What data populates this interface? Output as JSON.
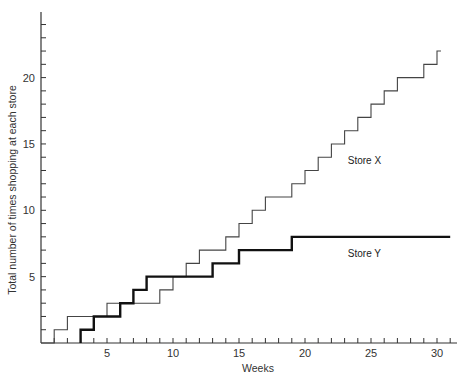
{
  "chart_data": {
    "type": "line",
    "subtype": "step",
    "title": "",
    "xlabel": "Weeks",
    "ylabel": "Total number of times shopping at each store",
    "xlim": [
      0,
      32
    ],
    "ylim": [
      0,
      25
    ],
    "x_ticks": [
      5,
      10,
      15,
      20,
      25,
      30
    ],
    "x_minor_step": 1,
    "y_ticks": [
      5,
      10,
      15,
      20
    ],
    "y_minor_step": 1,
    "grid": false,
    "legend": "inline labels",
    "series": [
      {
        "name": "Store X",
        "style": "thin",
        "label_pos": [
          24.5,
          13.5
        ],
        "points": [
          [
            0,
            0
          ],
          [
            1,
            1
          ],
          [
            2,
            2
          ],
          [
            5,
            3
          ],
          [
            9,
            4
          ],
          [
            10,
            5
          ],
          [
            11,
            6
          ],
          [
            12,
            7
          ],
          [
            14,
            8
          ],
          [
            15,
            9
          ],
          [
            16,
            10
          ],
          [
            17,
            11
          ],
          [
            19,
            12
          ],
          [
            20,
            13
          ],
          [
            21,
            14
          ],
          [
            22,
            15
          ],
          [
            23,
            16
          ],
          [
            24,
            17
          ],
          [
            25,
            18
          ],
          [
            26,
            19
          ],
          [
            27,
            20
          ],
          [
            29,
            21
          ],
          [
            30,
            22
          ],
          [
            30.3,
            22
          ]
        ]
      },
      {
        "name": "Store Y",
        "style": "thick",
        "label_pos": [
          24.5,
          6.5
        ],
        "points": [
          [
            3,
            0
          ],
          [
            3,
            1
          ],
          [
            4,
            2
          ],
          [
            6,
            3
          ],
          [
            7,
            4
          ],
          [
            8,
            5
          ],
          [
            13,
            6
          ],
          [
            15,
            7
          ],
          [
            19,
            8
          ],
          [
            31,
            8
          ]
        ]
      }
    ]
  },
  "axes": {
    "x_title": "Weeks",
    "y_title": "Total number of times shopping at each store"
  }
}
